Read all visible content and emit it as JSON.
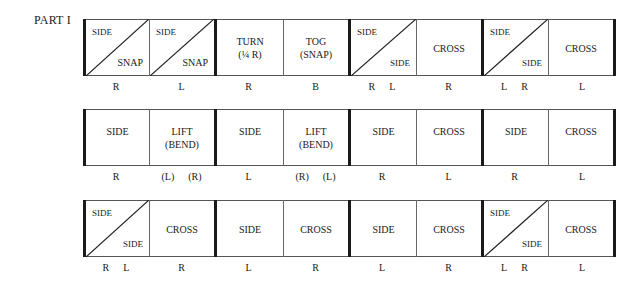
{
  "part_label": "PART I",
  "rows": [
    {
      "cells": [
        {
          "type": "diagonal",
          "top_left": "SIDE",
          "bottom_right": "SNAP",
          "foot": [
            "R"
          ]
        },
        {
          "type": "diagonal",
          "top_left": "SIDE",
          "bottom_right": "SNAP",
          "foot": [
            "L"
          ]
        },
        {
          "type": "text",
          "text": "TURN\n(¼ R)",
          "foot": [
            "R"
          ]
        },
        {
          "type": "text",
          "text": "TOG\n(SNAP)",
          "foot": [
            "B"
          ]
        },
        {
          "type": "diagonal",
          "top_left": "SIDE",
          "bottom_right": "SIDE",
          "foot": [
            "R",
            "L"
          ]
        },
        {
          "type": "text",
          "text": "CROSS",
          "foot": [
            "R"
          ]
        },
        {
          "type": "diagonal",
          "top_left": "SIDE",
          "bottom_right": "SIDE",
          "foot": [
            "L",
            "R"
          ]
        },
        {
          "type": "text",
          "text": "CROSS",
          "foot": [
            "L"
          ]
        }
      ]
    },
    {
      "cells": [
        {
          "type": "text",
          "text": "SIDE",
          "foot": [
            "R"
          ]
        },
        {
          "type": "text",
          "text": "LIFT\n(BEND)",
          "foot": [
            "(L)",
            "(R)"
          ]
        },
        {
          "type": "text",
          "text": "SIDE",
          "foot": [
            "L"
          ]
        },
        {
          "type": "text",
          "text": "LIFT\n(BEND)",
          "foot": [
            "(R)",
            "(L)"
          ]
        },
        {
          "type": "text",
          "text": "SIDE",
          "foot": [
            "R"
          ]
        },
        {
          "type": "text",
          "text": "CROSS",
          "foot": [
            "L"
          ]
        },
        {
          "type": "text",
          "text": "SIDE",
          "foot": [
            "R"
          ]
        },
        {
          "type": "text",
          "text": "CROSS",
          "foot": [
            "L"
          ]
        }
      ]
    },
    {
      "cells": [
        {
          "type": "diagonal",
          "top_left": "SIDE",
          "bottom_right": "SIDE",
          "foot": [
            "R",
            "L"
          ]
        },
        {
          "type": "text",
          "text": "CROSS",
          "foot": [
            "R"
          ]
        },
        {
          "type": "text",
          "text": "SIDE",
          "foot": [
            "L"
          ]
        },
        {
          "type": "text",
          "text": "CROSS",
          "foot": [
            "R"
          ]
        },
        {
          "type": "text",
          "text": "SIDE",
          "foot": [
            "L"
          ]
        },
        {
          "type": "text",
          "text": "CROSS",
          "foot": [
            "R"
          ]
        },
        {
          "type": "diagonal",
          "top_left": "SIDE",
          "bottom_right": "SIDE",
          "foot": [
            "L",
            "R"
          ]
        },
        {
          "type": "text",
          "text": "CROSS",
          "foot": [
            "L"
          ]
        }
      ]
    }
  ]
}
